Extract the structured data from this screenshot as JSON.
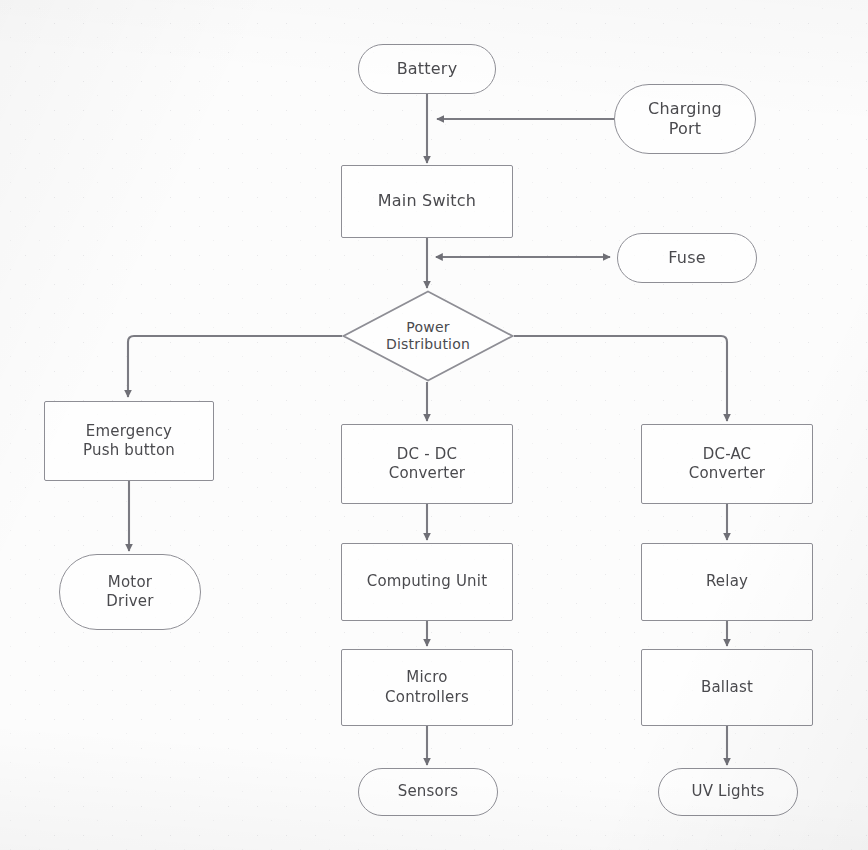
{
  "diagram": {
    "type": "flowchart",
    "style": {
      "stroke_color": "#8e8e95",
      "text_color": "#4a4a4e",
      "background_color": "#fcfcfc",
      "grid": "dotted"
    },
    "nodes": [
      {
        "id": "battery",
        "label": "Battery",
        "shape": "rounded",
        "x": 358,
        "y": 44,
        "w": 138,
        "h": 50,
        "font": 16
      },
      {
        "id": "charging_port",
        "label": "Charging\nPort",
        "shape": "rounded",
        "x": 614,
        "y": 84,
        "w": 142,
        "h": 70,
        "font": 16
      },
      {
        "id": "main_switch",
        "label": "Main Switch",
        "shape": "rectangle",
        "x": 341,
        "y": 165,
        "w": 172,
        "h": 73,
        "font": 16
      },
      {
        "id": "fuse",
        "label": "Fuse",
        "shape": "rounded",
        "x": 617,
        "y": 233,
        "w": 140,
        "h": 50,
        "font": 16
      },
      {
        "id": "power_dist",
        "label": "Power\nDistribution",
        "shape": "diamond",
        "x": 342,
        "y": 290,
        "w": 172,
        "h": 92,
        "font": 14
      },
      {
        "id": "emergency_btn",
        "label": "Emergency\nPush button",
        "shape": "rectangle",
        "x": 44,
        "y": 401,
        "w": 170,
        "h": 80,
        "font": 15
      },
      {
        "id": "motor_driver",
        "label": "Motor\nDriver",
        "shape": "rounded",
        "x": 59,
        "y": 554,
        "w": 142,
        "h": 76,
        "font": 15
      },
      {
        "id": "dcdc",
        "label": "DC - DC\nConverter",
        "shape": "rectangle",
        "x": 341,
        "y": 424,
        "w": 172,
        "h": 80,
        "font": 15
      },
      {
        "id": "computing_unit",
        "label": "Computing Unit",
        "shape": "rectangle",
        "x": 341,
        "y": 543,
        "w": 172,
        "h": 78,
        "font": 15
      },
      {
        "id": "micro_ctrl",
        "label": "Micro\nControllers",
        "shape": "rectangle",
        "x": 341,
        "y": 649,
        "w": 172,
        "h": 77,
        "font": 15
      },
      {
        "id": "sensors",
        "label": "Sensors",
        "shape": "rounded",
        "x": 358,
        "y": 768,
        "w": 140,
        "h": 48,
        "font": 15
      },
      {
        "id": "dcac",
        "label": "DC-AC\nConverter",
        "shape": "rectangle",
        "x": 641,
        "y": 424,
        "w": 172,
        "h": 80,
        "font": 15
      },
      {
        "id": "relay",
        "label": "Relay",
        "shape": "rectangle",
        "x": 641,
        "y": 543,
        "w": 172,
        "h": 78,
        "font": 15
      },
      {
        "id": "ballast",
        "label": "Ballast",
        "shape": "rectangle",
        "x": 641,
        "y": 649,
        "w": 172,
        "h": 77,
        "font": 15
      },
      {
        "id": "uv_lights",
        "label": "UV Lights",
        "shape": "rounded",
        "x": 658,
        "y": 768,
        "w": 140,
        "h": 48,
        "font": 15
      }
    ],
    "edges": [
      {
        "from": "battery",
        "to": "main_switch",
        "kind": "straight-down",
        "arrow": "end"
      },
      {
        "from": "charging_port",
        "to": "battery",
        "kind": "horizontal",
        "arrow": "end"
      },
      {
        "from": "main_switch",
        "to": "fuse",
        "kind": "horizontal",
        "arrow": "both"
      },
      {
        "from": "main_switch",
        "to": "power_dist",
        "kind": "straight-down",
        "arrow": "end"
      },
      {
        "from": "power_dist",
        "to": "emergency_btn",
        "kind": "elbow-left",
        "arrow": "end"
      },
      {
        "from": "power_dist",
        "to": "dcdc",
        "kind": "straight-down",
        "arrow": "end"
      },
      {
        "from": "power_dist",
        "to": "dcac",
        "kind": "elbow-right",
        "arrow": "end"
      },
      {
        "from": "emergency_btn",
        "to": "motor_driver",
        "kind": "straight-down",
        "arrow": "end"
      },
      {
        "from": "dcdc",
        "to": "computing_unit",
        "kind": "straight-down",
        "arrow": "end"
      },
      {
        "from": "computing_unit",
        "to": "micro_ctrl",
        "kind": "straight-down",
        "arrow": "end"
      },
      {
        "from": "micro_ctrl",
        "to": "sensors",
        "kind": "straight-down",
        "arrow": "end"
      },
      {
        "from": "dcac",
        "to": "relay",
        "kind": "straight-down",
        "arrow": "end"
      },
      {
        "from": "relay",
        "to": "ballast",
        "kind": "straight-down",
        "arrow": "end"
      },
      {
        "from": "ballast",
        "to": "uv_lights",
        "kind": "straight-down",
        "arrow": "end"
      }
    ]
  }
}
